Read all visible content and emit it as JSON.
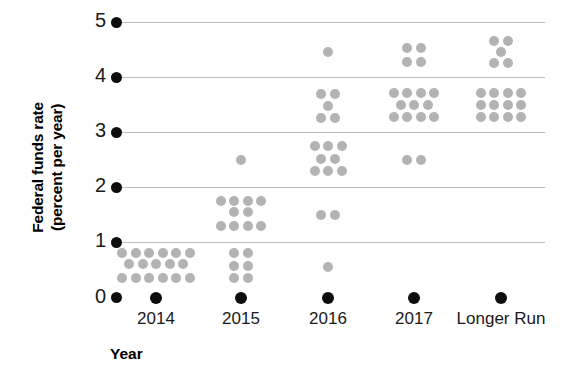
{
  "chart_data": {
    "type": "scatter",
    "title": "",
    "xlabel": "Year",
    "ylabel": "Federal funds rate (percent per year)",
    "ylabel_line1": "Federal funds rate",
    "ylabel_line2": "(percent per year)",
    "ylim": [
      0,
      5
    ],
    "yticks": [
      0,
      1,
      2,
      3,
      4,
      5
    ],
    "ytick_labels": [
      "0",
      "1",
      "2",
      "3",
      "4",
      "5"
    ],
    "categories": [
      "2014",
      "2015",
      "2016",
      "2017",
      "Longer Run"
    ],
    "grid": true,
    "legend": false,
    "dot_color": "#b3b3b3",
    "axis_color": "#0d0d0d",
    "gridline_color": "#bdbdbd",
    "series": [
      {
        "name": "2014",
        "category": "2014",
        "total_dots": 17,
        "rows": [
          {
            "value": 0.8,
            "count": 6
          },
          {
            "value": 0.6,
            "count": 5
          },
          {
            "value": 0.35,
            "count": 6
          }
        ]
      },
      {
        "name": "2015",
        "category": "2015",
        "total_dots": 17,
        "rows": [
          {
            "value": 2.5,
            "count": 1
          },
          {
            "value": 1.75,
            "count": 4
          },
          {
            "value": 1.55,
            "count": 2
          },
          {
            "value": 1.3,
            "count": 4
          },
          {
            "value": 0.8,
            "count": 2
          },
          {
            "value": 0.58,
            "count": 2
          },
          {
            "value": 0.35,
            "count": 2
          }
        ]
      },
      {
        "name": "2016",
        "category": "2016",
        "total_dots": 17,
        "rows": [
          {
            "value": 4.45,
            "count": 1
          },
          {
            "value": 3.7,
            "count": 2
          },
          {
            "value": 3.48,
            "count": 1
          },
          {
            "value": 3.25,
            "count": 2
          },
          {
            "value": 2.75,
            "count": 3
          },
          {
            "value": 2.52,
            "count": 2
          },
          {
            "value": 2.3,
            "count": 3
          },
          {
            "value": 1.5,
            "count": 2
          },
          {
            "value": 0.55,
            "count": 1
          }
        ]
      },
      {
        "name": "2017",
        "category": "2017",
        "total_dots": 15,
        "rows": [
          {
            "value": 4.52,
            "count": 2
          },
          {
            "value": 4.28,
            "count": 2
          },
          {
            "value": 3.72,
            "count": 4
          },
          {
            "value": 3.5,
            "count": 3
          },
          {
            "value": 3.28,
            "count": 4
          },
          {
            "value": 2.5,
            "count": 2
          }
        ]
      },
      {
        "name": "Longer Run",
        "category": "Longer Run",
        "total_dots": 17,
        "rows": [
          {
            "value": 4.65,
            "count": 2
          },
          {
            "value": 4.45,
            "count": 1
          },
          {
            "value": 4.25,
            "count": 2
          },
          {
            "value": 3.72,
            "count": 4
          },
          {
            "value": 3.5,
            "count": 4
          },
          {
            "value": 3.28,
            "count": 4
          }
        ]
      }
    ]
  }
}
